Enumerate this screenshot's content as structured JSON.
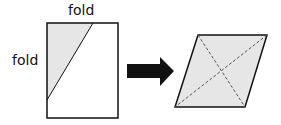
{
  "labels": {
    "top_fold": "fold",
    "left_fold": "fold"
  },
  "colors": {
    "shade": "#e6e6e6",
    "stroke": "#111111",
    "arrow": "#111111",
    "dashed": "#666666"
  },
  "diagram": {
    "left_shape": "rectangle with corner folded along diagonal line",
    "arrow": "right-arrow",
    "right_shape": "parallelogram with dashed diagonals"
  }
}
